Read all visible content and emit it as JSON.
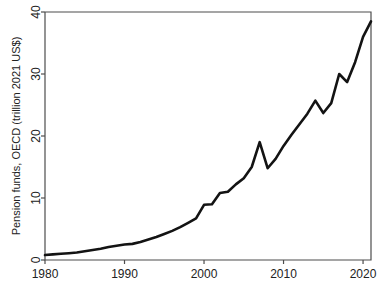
{
  "chart_data": {
    "type": "line",
    "title": "",
    "xlabel": "",
    "ylabel": "Pension funds, OECD (trillion 2021 US$)",
    "xlim": [
      1980,
      2021
    ],
    "ylim": [
      0,
      40
    ],
    "xticks": [
      "1980",
      "1990",
      "2000",
      "2010",
      "2020"
    ],
    "xtick_values": [
      1980,
      1990,
      2000,
      2010,
      2020
    ],
    "yticks": [
      "0",
      "10",
      "20",
      "30",
      "40"
    ],
    "ytick_values": [
      0,
      10,
      20,
      30,
      40
    ],
    "grid": false,
    "legend": false,
    "legend_position": "none",
    "line_color": "#131313",
    "background_color": "#ffffff",
    "frame_color": "#4d4d4d",
    "series": [
      {
        "name": "Pension funds, OECD",
        "x": [
          1980,
          1981,
          1982,
          1983,
          1984,
          1985,
          1986,
          1987,
          1988,
          1989,
          1990,
          1991,
          1992,
          1993,
          1994,
          1995,
          1996,
          1997,
          1998,
          1999,
          2000,
          2001,
          2002,
          2003,
          2004,
          2005,
          2006,
          2007,
          2008,
          2009,
          2010,
          2011,
          2012,
          2013,
          2014,
          2015,
          2016,
          2017,
          2018,
          2019,
          2020,
          2021
        ],
        "values": [
          0.8,
          0.9,
          1.0,
          1.1,
          1.2,
          1.4,
          1.6,
          1.8,
          2.1,
          2.3,
          2.5,
          2.6,
          2.9,
          3.3,
          3.7,
          4.2,
          4.7,
          5.3,
          6.0,
          6.7,
          8.9,
          9.0,
          10.8,
          11.0,
          12.2,
          13.2,
          15.0,
          19.0,
          14.8,
          16.3,
          18.4,
          20.2,
          21.9,
          23.6,
          25.7,
          23.7,
          25.3,
          30.0,
          28.7,
          31.9,
          36.0,
          38.5
        ]
      }
    ]
  }
}
